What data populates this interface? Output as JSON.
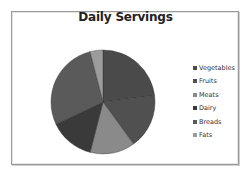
{
  "chart_data": {
    "type": "pie",
    "title": "Daily Servings",
    "categories": [
      "Vegetables",
      "Fruits",
      "Meats",
      "Dairy",
      "Breads",
      "Fats"
    ],
    "values": [
      23,
      17,
      14,
      14,
      28,
      4
    ],
    "unit": "percent (estimated)",
    "colors": [
      "#4a4a4a",
      "#505050",
      "#8a8a8a",
      "#3a3a3a",
      "#5a5a5a",
      "#9c9c9c"
    ],
    "start_angle": "12 o'clock",
    "direction": "clockwise",
    "legend_position": "right",
    "grid": false
  },
  "legend": {
    "items": [
      {
        "label": "Vegetables",
        "color": "#4a4a4a"
      },
      {
        "label": "Fruits",
        "color": "#505050"
      },
      {
        "label": "Meats",
        "color": "#8a8a8a"
      },
      {
        "label": "Dairy",
        "color": "#3a3a3a"
      },
      {
        "label": "Breads",
        "color": "#5a5a5a"
      },
      {
        "label": "Fats",
        "color": "#9c9c9c"
      }
    ]
  }
}
